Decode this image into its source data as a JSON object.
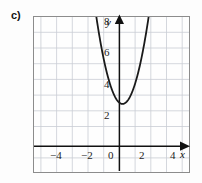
{
  "figure": {
    "part_label": "c)",
    "background_color": "#fdfdfd",
    "frame_color": "#8c8c8c",
    "grid_color": "#c9cdd4",
    "curve_color": "#1a1a1a",
    "axis_color": "#111111"
  },
  "axes": {
    "x_name": "x",
    "y_name": "y",
    "x_tick_labels": [
      "−4",
      "−2",
      "0",
      "2",
      "4"
    ],
    "x_tick_values": [
      -4,
      -2,
      0,
      2,
      4
    ],
    "y_tick_labels": [
      "2",
      "4",
      "6",
      "8"
    ],
    "y_tick_values": [
      2,
      4,
      6,
      8
    ],
    "origin_label": "0"
  },
  "chart_data": {
    "type": "line",
    "title": "",
    "subtitle": "",
    "xlabel": "x",
    "ylabel": "y",
    "xlim": [
      -5.4,
      4.6
    ],
    "ylim": [
      -1.4,
      8.6
    ],
    "xticks": [
      -4,
      -2,
      0,
      2,
      4
    ],
    "yticks": [
      2,
      4,
      6,
      8
    ],
    "xtick_labels": [
      "−4",
      "−2",
      "0",
      "2",
      "4"
    ],
    "ytick_labels": [
      "2",
      "4",
      "6",
      "8"
    ],
    "grid": true,
    "grid_step": 1,
    "legend": null,
    "annotations": [
      "c)"
    ],
    "series": [
      {
        "name": "parabola",
        "kind": "parabola",
        "equation": "y = 2(x - 0.3)^2 + 3",
        "vertex": [
          0.3,
          3.0
        ],
        "leading_coefficient": 2.0,
        "opens": "up",
        "color": "#1a1a1a",
        "linewidth": 1.7,
        "x": [
          -2.35,
          -2.2,
          -2.0,
          -1.8,
          -1.6,
          -1.4,
          -1.2,
          -1.0,
          -0.8,
          -0.6,
          -0.4,
          -0.2,
          0.0,
          0.3,
          0.6,
          0.8,
          1.0,
          1.2,
          1.4,
          1.6,
          1.8,
          2.0,
          2.2,
          2.4,
          2.6,
          2.8,
          2.95
        ],
        "y": [
          17.03,
          15.5,
          13.58,
          11.82,
          10.22,
          8.78,
          7.5,
          6.38,
          5.42,
          4.62,
          3.98,
          3.5,
          3.18,
          3.0,
          3.18,
          3.5,
          3.98,
          4.62,
          5.42,
          6.38,
          7.5,
          8.78,
          10.22,
          11.82,
          13.58,
          15.5,
          16.51
        ]
      }
    ]
  }
}
